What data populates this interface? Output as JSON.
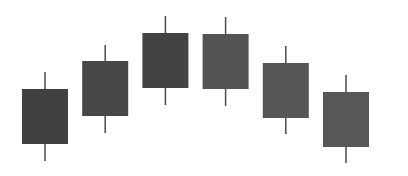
{
  "chart_data": {
    "type": "candlestick",
    "title": "",
    "xlabel": "",
    "ylabel": "",
    "grid": false,
    "legend": "none",
    "ylim": [
      0,
      176
    ],
    "categories": [
      "1",
      "2",
      "3",
      "4",
      "5",
      "6"
    ],
    "candles": [
      {
        "label": "1",
        "high": 104,
        "body_top": 87,
        "body_bottom": 32,
        "low": 15,
        "color": "#414141"
      },
      {
        "label": "2",
        "high": 131,
        "body_top": 115,
        "body_bottom": 60,
        "low": 43,
        "color": "#474747"
      },
      {
        "label": "3",
        "high": 160,
        "body_top": 143,
        "body_bottom": 88,
        "low": 71,
        "color": "#434343"
      },
      {
        "label": "4",
        "high": 159,
        "body_top": 142,
        "body_bottom": 87,
        "low": 70,
        "color": "#545454"
      },
      {
        "label": "5",
        "high": 130,
        "body_top": 113,
        "body_bottom": 58,
        "low": 42,
        "color": "#555555"
      },
      {
        "label": "6",
        "high": 101,
        "body_top": 84,
        "body_bottom": 29,
        "low": 13,
        "color": "#575757"
      }
    ],
    "wick_color": "#4a4a4a"
  }
}
